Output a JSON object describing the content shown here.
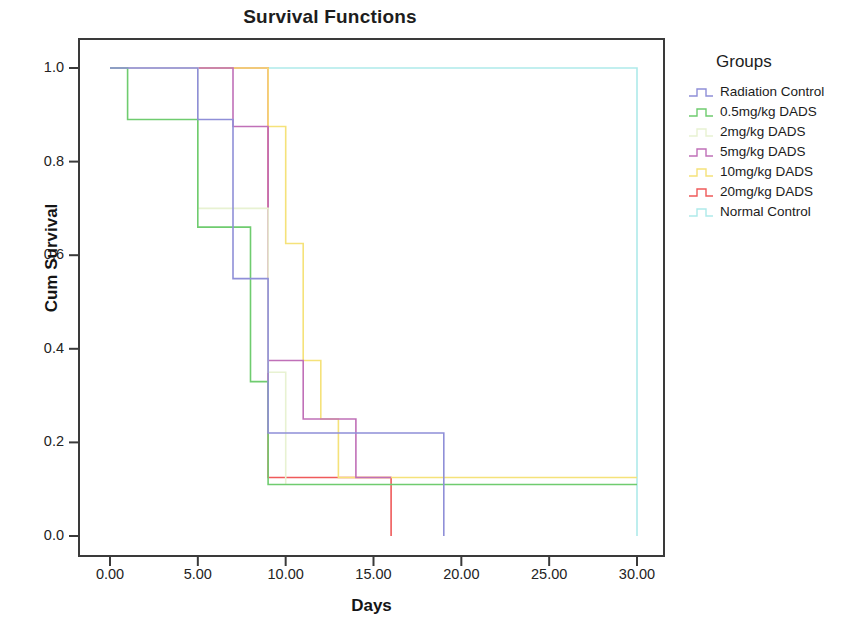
{
  "chart_data": {
    "type": "line",
    "title": "Survival Functions",
    "xlabel": "Days",
    "ylabel": "Cum Survival",
    "xlim": [
      0,
      31.5
    ],
    "ylim": [
      -0.04,
      1.06
    ],
    "xticks": [
      "0.00",
      "5.00",
      "10.00",
      "15.00",
      "20.00",
      "25.00",
      "30.00"
    ],
    "xtick_values": [
      0,
      5,
      10,
      15,
      20,
      25,
      30
    ],
    "yticks": [
      "0.0",
      "0.2",
      "0.4",
      "0.6",
      "0.8",
      "1.0"
    ],
    "ytick_values": [
      0.0,
      0.2,
      0.4,
      0.6,
      0.8,
      1.0
    ],
    "grid": false,
    "legend_position": "right",
    "legend_title": "Groups",
    "step_type": "post",
    "series": [
      {
        "name": "Radiation Control",
        "color": "#8f8fd8",
        "x": [
          0,
          5,
          5,
          7,
          7,
          9,
          9,
          19,
          19
        ],
        "y": [
          1.0,
          1.0,
          0.89,
          0.89,
          0.55,
          0.55,
          0.22,
          0.22,
          0.0
        ],
        "points": [
          {
            "day": 0,
            "surv": 1.0
          },
          {
            "day": 5,
            "surv": 0.89
          },
          {
            "day": 7,
            "surv": 0.55
          },
          {
            "day": 9,
            "surv": 0.22
          },
          {
            "day": 9.4,
            "surv": 0.11
          },
          {
            "day": 19,
            "surv": 0.0
          }
        ]
      },
      {
        "name": "0.5mg/kg DADS",
        "color": "#6fcc6f",
        "x": [
          0,
          1,
          1,
          5,
          5,
          8,
          8,
          9,
          9,
          30
        ],
        "y": [
          1.0,
          1.0,
          0.89,
          0.89,
          0.66,
          0.66,
          0.33,
          0.33,
          0.11,
          0.11
        ],
        "points": [
          {
            "day": 0,
            "surv": 1.0
          },
          {
            "day": 1,
            "surv": 0.89
          },
          {
            "day": 5,
            "surv": 0.66
          },
          {
            "day": 8,
            "surv": 0.33
          },
          {
            "day": 9,
            "surv": 0.11
          }
        ]
      },
      {
        "name": "2mg/kg DADS",
        "color": "#e8f2d2",
        "x": [
          0,
          5,
          5,
          9,
          9,
          10,
          10
        ],
        "y": [
          1.0,
          1.0,
          0.7,
          0.7,
          0.35,
          0.35,
          0.11
        ],
        "points": [
          {
            "day": 0,
            "surv": 1.0
          },
          {
            "day": 5,
            "surv": 0.7
          },
          {
            "day": 9,
            "surv": 0.35
          },
          {
            "day": 10,
            "surv": 0.11
          },
          {
            "day": 10,
            "surv": 0.0
          }
        ]
      },
      {
        "name": "5mg/kg DADS",
        "color": "#c070b8",
        "x": [
          0,
          7,
          7,
          9,
          9,
          11,
          11,
          14,
          14,
          16
        ],
        "y": [
          1.0,
          1.0,
          0.875,
          0.875,
          0.375,
          0.375,
          0.25,
          0.25,
          0.125,
          0.125
        ],
        "points": [
          {
            "day": 0,
            "surv": 1.0
          },
          {
            "day": 7,
            "surv": 0.875
          },
          {
            "day": 9,
            "surv": 0.375
          },
          {
            "day": 11,
            "surv": 0.25
          },
          {
            "day": 14,
            "surv": 0.125
          }
        ]
      },
      {
        "name": "10mg/kg DADS",
        "color": "#f5e27a",
        "x": [
          0,
          9,
          9,
          10,
          10,
          11,
          11,
          12,
          12,
          13,
          13,
          30
        ],
        "y": [
          1.0,
          1.0,
          0.875,
          0.875,
          0.625,
          0.625,
          0.375,
          0.375,
          0.25,
          0.25,
          0.125,
          0.125
        ],
        "points": [
          {
            "day": 0,
            "surv": 1.0
          },
          {
            "day": 9,
            "surv": 0.875
          },
          {
            "day": 10,
            "surv": 0.625
          },
          {
            "day": 11,
            "surv": 0.375
          },
          {
            "day": 12,
            "surv": 0.25
          },
          {
            "day": 13,
            "surv": 0.125
          },
          {
            "day": 30,
            "surv": 0.125
          }
        ]
      },
      {
        "name": "20mg/kg DADS",
        "color": "#ef5a5a",
        "x": [
          0,
          9,
          9,
          16,
          16
        ],
        "y": [
          1.0,
          1.0,
          0.125,
          0.125,
          0.0
        ],
        "points": [
          {
            "day": 0,
            "surv": 1.0
          },
          {
            "day": 9,
            "surv": 0.125
          },
          {
            "day": 16,
            "surv": 0.0
          }
        ]
      },
      {
        "name": "Normal Control",
        "color": "#aeeaea",
        "x": [
          0,
          30,
          30
        ],
        "y": [
          1.0,
          1.0,
          0.0
        ],
        "points": [
          {
            "day": 0,
            "surv": 1.0
          },
          {
            "day": 30,
            "surv": 1.0
          },
          {
            "day": 30,
            "surv": 0.0
          }
        ]
      }
    ]
  },
  "axes": {
    "frame_color": "#3a3a3a",
    "tick_color": "#3a3a3a"
  }
}
